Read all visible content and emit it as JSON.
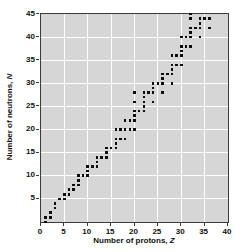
{
  "chart_data": {
    "type": "scatter",
    "title": "",
    "xlabel": "Number of protons, Z",
    "ylabel": "Number of neutrons, N",
    "xlabel_prefix": "Number of protons, ",
    "xlabel_var": "Z",
    "ylabel_prefix": "Number of neutrons, ",
    "ylabel_var": "N",
    "xlim": [
      0,
      40
    ],
    "ylim": [
      0,
      45
    ],
    "x_tick_labels": [
      0,
      5,
      10,
      15,
      20,
      25,
      30,
      35,
      40
    ],
    "y_tick_labels": [
      5,
      10,
      15,
      20,
      25,
      30,
      35,
      40,
      45
    ],
    "grid": true,
    "legend": "none",
    "marker": "square",
    "points_zn": [
      [
        1,
        0
      ],
      [
        1,
        1
      ],
      [
        2,
        1
      ],
      [
        2,
        2
      ],
      [
        3,
        3
      ],
      [
        3,
        4
      ],
      [
        4,
        5
      ],
      [
        5,
        5
      ],
      [
        5,
        6
      ],
      [
        6,
        6
      ],
      [
        6,
        7
      ],
      [
        7,
        7
      ],
      [
        7,
        8
      ],
      [
        8,
        8
      ],
      [
        8,
        9
      ],
      [
        8,
        10
      ],
      [
        9,
        10
      ],
      [
        10,
        10
      ],
      [
        10,
        11
      ],
      [
        10,
        12
      ],
      [
        11,
        12
      ],
      [
        12,
        12
      ],
      [
        12,
        13
      ],
      [
        12,
        14
      ],
      [
        13,
        14
      ],
      [
        14,
        14
      ],
      [
        14,
        15
      ],
      [
        14,
        16
      ],
      [
        15,
        16
      ],
      [
        16,
        16
      ],
      [
        16,
        17
      ],
      [
        16,
        18
      ],
      [
        16,
        20
      ],
      [
        17,
        18
      ],
      [
        17,
        20
      ],
      [
        18,
        18
      ],
      [
        18,
        20
      ],
      [
        18,
        22
      ],
      [
        19,
        20
      ],
      [
        19,
        22
      ],
      [
        20,
        20
      ],
      [
        20,
        22
      ],
      [
        20,
        23
      ],
      [
        20,
        24
      ],
      [
        20,
        26
      ],
      [
        20,
        28
      ],
      [
        21,
        24
      ],
      [
        22,
        24
      ],
      [
        22,
        25
      ],
      [
        22,
        26
      ],
      [
        22,
        27
      ],
      [
        22,
        28
      ],
      [
        23,
        28
      ],
      [
        24,
        26
      ],
      [
        24,
        28
      ],
      [
        24,
        29
      ],
      [
        24,
        30
      ],
      [
        25,
        30
      ],
      [
        26,
        28
      ],
      [
        26,
        30
      ],
      [
        26,
        31
      ],
      [
        26,
        32
      ],
      [
        27,
        32
      ],
      [
        28,
        30
      ],
      [
        28,
        32
      ],
      [
        28,
        33
      ],
      [
        28,
        34
      ],
      [
        28,
        36
      ],
      [
        29,
        34
      ],
      [
        29,
        36
      ],
      [
        30,
        34
      ],
      [
        30,
        36
      ],
      [
        30,
        37
      ],
      [
        30,
        38
      ],
      [
        30,
        40
      ],
      [
        31,
        38
      ],
      [
        31,
        40
      ],
      [
        32,
        38
      ],
      [
        32,
        40
      ],
      [
        32,
        41
      ],
      [
        32,
        42
      ],
      [
        32,
        44
      ],
      [
        32,
        45
      ],
      [
        33,
        42
      ],
      [
        34,
        40
      ],
      [
        34,
        42
      ],
      [
        34,
        43
      ],
      [
        34,
        44
      ],
      [
        35,
        44
      ],
      [
        36,
        42
      ],
      [
        36,
        44
      ]
    ],
    "colors": {
      "page_bg": "#ffffff",
      "plot_bg": "#d6d6d6",
      "grid": "#ffffff",
      "frame": "#3c3c3c",
      "point": "#0d0d0d",
      "text": "#111111"
    }
  }
}
